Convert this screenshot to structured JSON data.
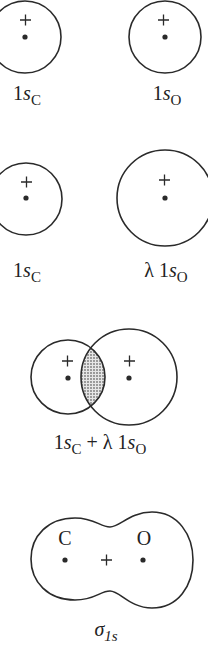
{
  "panels": [
    {
      "id": "row1",
      "labels": {
        "left_main": "1",
        "left_var": "s",
        "left_sub": "C",
        "right_main": "1",
        "right_var": "s",
        "right_sub": "O"
      }
    },
    {
      "id": "row2",
      "labels": {
        "left_main": "1",
        "left_var": "s",
        "left_sub": "C",
        "right_prefix": "λ 1",
        "right_var": "s",
        "right_sub": "O"
      }
    },
    {
      "id": "row3",
      "labels": {
        "main1": "1",
        "var1": "s",
        "sub1": "C",
        "mid": " + λ 1",
        "var2": "s",
        "sub2": "O"
      }
    },
    {
      "id": "row4",
      "labels": {
        "atom_left": "C",
        "atom_right": "O",
        "center_sign": "+",
        "sigma": "σ",
        "sigma_sub": "1s"
      }
    }
  ],
  "signs": {
    "plus": "+"
  },
  "colors": {
    "stroke": "#2a2a2a",
    "shade": "#b8b8b8",
    "background": "#ffffff"
  }
}
